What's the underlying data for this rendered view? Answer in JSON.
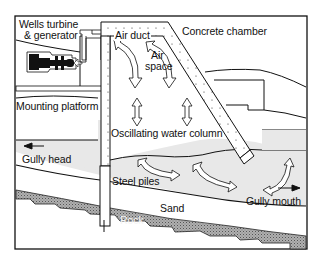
{
  "diagram": {
    "labels": {
      "turbine_line1": "Wells turbine",
      "turbine_line2": "& generator",
      "air_duct": "Air duct",
      "concrete_chamber": "Concrete chamber",
      "air_space_line1": "Air",
      "air_space_line2": "space",
      "mounting_platform": "Mounting platform",
      "oscillating_water_column": "Oscillating water column",
      "gully_head": "Gully head",
      "steel_piles": "Steel piles",
      "gully_mouth": "Gully mouth",
      "sand": "Sand",
      "rock": "Rock"
    },
    "colors": {
      "line": "#111111",
      "water": "#e8e8e8",
      "rock": "#9a9a9a",
      "background": "#ffffff"
    }
  }
}
